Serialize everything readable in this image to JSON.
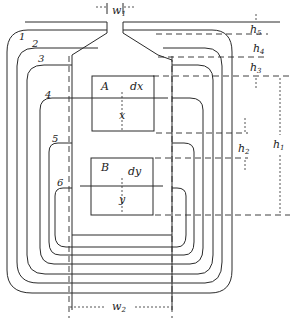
{
  "diagram": {
    "type": "transformer-winding-cross-section",
    "coil_labels": [
      "1",
      "2",
      "3",
      "4",
      "5",
      "6"
    ],
    "regions": {
      "a": "A",
      "b": "B"
    },
    "differentials": {
      "dx": "dx",
      "dy": "dy",
      "x": "x",
      "y": "y"
    },
    "dimensions": {
      "w1": {
        "base": "w",
        "sub": "1"
      },
      "w2": {
        "base": "w",
        "sub": "2"
      },
      "h1": {
        "base": "h",
        "sub": "1"
      },
      "h2": {
        "base": "h",
        "sub": "2"
      },
      "h3": {
        "base": "h",
        "sub": "3"
      },
      "h4": {
        "base": "h",
        "sub": "4"
      },
      "h5": {
        "base": "h",
        "sub": "5"
      }
    },
    "caption": "Fig. 5-5. Winding layout."
  },
  "colors": {
    "ink": "#2a2a2a",
    "paper": "#ffffff"
  }
}
